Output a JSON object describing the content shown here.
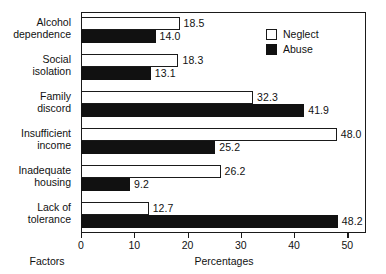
{
  "chart_data": {
    "type": "bar",
    "orientation": "horizontal",
    "title": "",
    "xlabel": "Percentages",
    "ylabel": "Factors",
    "xlim": [
      0,
      53.5
    ],
    "ticks": [
      0,
      10,
      20,
      30,
      40,
      50
    ],
    "tick_labels": [
      "0",
      "10",
      "20",
      "30",
      "40",
      "50"
    ],
    "grid": false,
    "legend_position": "top-right",
    "categories": [
      "Alcohol dependence",
      "Social isolation",
      "Family discord",
      "Insufficient income",
      "Inadequate housing",
      "Lack of tolerance"
    ],
    "category_lines": [
      [
        "Alcohol",
        "dependence"
      ],
      [
        "Social",
        "isolation"
      ],
      [
        "Family",
        "discord"
      ],
      [
        "Insufficient",
        "income"
      ],
      [
        "Inadequate",
        "housing"
      ],
      [
        "Lack of",
        "tolerance"
      ]
    ],
    "series": [
      {
        "name": "Neglect",
        "color": "#ffffff",
        "edge_color": "#1a1a1a",
        "values": [
          18.5,
          18.3,
          32.3,
          48.0,
          26.2,
          12.7
        ],
        "value_labels": [
          "18.5",
          "18.3",
          "32.3",
          "48.0",
          "26.2",
          "12.7"
        ]
      },
      {
        "name": "Abuse",
        "color": "#111111",
        "edge_color": "#111111",
        "values": [
          14.0,
          13.1,
          41.9,
          25.2,
          9.2,
          48.2
        ],
        "value_labels": [
          "14.0",
          "13.1",
          "41.9",
          "25.2",
          "9.2",
          "48.2"
        ]
      }
    ]
  },
  "legend": {
    "items": [
      {
        "label": "Neglect",
        "swatch": "white-square-outline"
      },
      {
        "label": "Abuse",
        "swatch": "black-square-filled"
      }
    ]
  },
  "axis_titles": {
    "x": "Percentages",
    "y": "Factors"
  }
}
